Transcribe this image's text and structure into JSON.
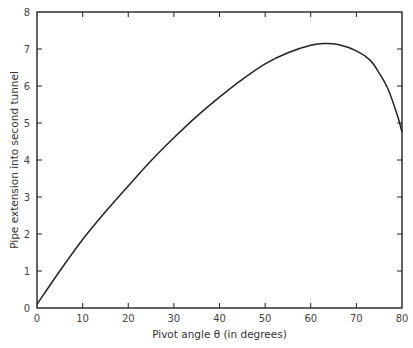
{
  "chart_data": {
    "type": "line",
    "title": "",
    "xlabel": "Pivot  angle θ (in degrees)",
    "ylabel": "Pipe extension into second tunnel",
    "xlim": [
      0,
      80
    ],
    "ylim": [
      0,
      8
    ],
    "x_ticks": [
      0,
      10,
      20,
      30,
      40,
      50,
      60,
      70,
      80
    ],
    "y_ticks": [
      0,
      1,
      2,
      3,
      4,
      5,
      6,
      7,
      8
    ],
    "grid": false,
    "legend": null,
    "series": [
      {
        "name": "Pipe extension",
        "color": "#222222",
        "x": [
          0,
          5,
          10,
          15,
          20,
          25,
          30,
          35,
          40,
          45,
          50,
          55,
          60,
          63,
          66,
          70,
          73,
          75,
          77,
          79,
          80
        ],
        "y": [
          0.1,
          1.0,
          1.85,
          2.6,
          3.3,
          3.98,
          4.6,
          5.18,
          5.7,
          6.18,
          6.6,
          6.9,
          7.1,
          7.15,
          7.12,
          6.95,
          6.7,
          6.35,
          5.9,
          5.2,
          4.75
        ]
      }
    ]
  }
}
